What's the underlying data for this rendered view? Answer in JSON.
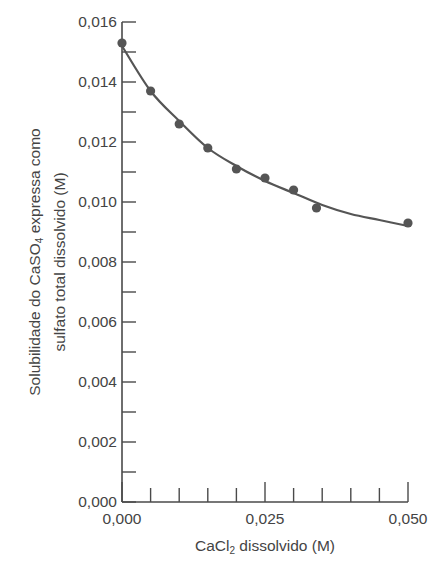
{
  "chart_data": {
    "type": "scatter",
    "title": "",
    "xlabel_parts": [
      "CaCl",
      "2",
      " dissolvido (M)"
    ],
    "xlabel": "CaCl2 dissolvido (M)",
    "ylabel_line1_parts": [
      "Solubilidade do CaSO",
      "4",
      " expressa como"
    ],
    "ylabel_line2": "sulfato total dissolvido (M)",
    "ylabel": "Solubilidade do CaSO4 expressa como sulfato total dissolvido (M)",
    "xlim": [
      0,
      0.05
    ],
    "ylim": [
      0,
      0.016
    ],
    "x_ticks": [
      0.0,
      0.025,
      0.05
    ],
    "x_tick_labels": [
      "0,000",
      "0,025",
      "0,050"
    ],
    "x_minor_step": 0.005,
    "y_ticks": [
      0.0,
      0.002,
      0.004,
      0.006,
      0.008,
      0.01,
      0.012,
      0.014,
      0.016
    ],
    "y_tick_labels": [
      "0,000",
      "0,002",
      "0,004",
      "0,006",
      "0,008",
      "0,010",
      "0,012",
      "0,014",
      "0,016"
    ],
    "y_minor_step": 0.001,
    "grid": false,
    "legend": null,
    "series": [
      {
        "name": "Dados experimentais",
        "kind": "points",
        "x": [
          0.0,
          0.005,
          0.01,
          0.015,
          0.02,
          0.025,
          0.03,
          0.034,
          0.05
        ],
        "y": [
          0.0153,
          0.0137,
          0.0126,
          0.0118,
          0.0111,
          0.0108,
          0.0104,
          0.0098,
          0.0093
        ]
      },
      {
        "name": "Curva ajustada",
        "kind": "smooth-line",
        "x": [
          0.0,
          0.005,
          0.01,
          0.015,
          0.02,
          0.025,
          0.03,
          0.035,
          0.04,
          0.045,
          0.05
        ],
        "y": [
          0.0152,
          0.0137,
          0.0127,
          0.0118,
          0.0112,
          0.0107,
          0.0103,
          0.0099,
          0.0096,
          0.0094,
          0.0092
        ]
      }
    ],
    "colors": {
      "axis": "#4a4a4a",
      "points": "#555555",
      "line": "#555555",
      "text": "#444444"
    }
  }
}
